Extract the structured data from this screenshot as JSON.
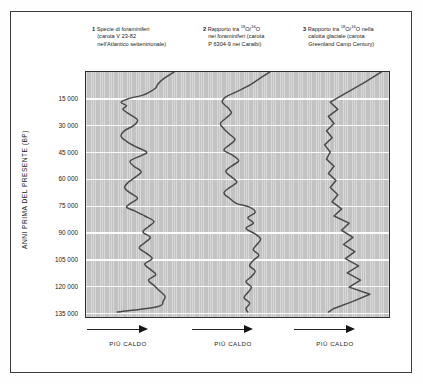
{
  "figure": {
    "yaxis": {
      "title": "ANNI PRIMA DEL PRESENTE (BP)",
      "ticks": [
        "15 000",
        "30 000",
        "45 000",
        "60 000",
        "75 000",
        "90 000",
        "105 000",
        "120 000",
        "135 000"
      ],
      "tick_values": [
        15000,
        30000,
        45000,
        60000,
        75000,
        90000,
        105000,
        120000,
        135000
      ],
      "range": [
        0,
        138000
      ]
    },
    "panels": [
      {
        "number": "1",
        "lines": [
          "Specie di foraminiferi",
          "(carota V 23-82",
          "nell'Atlantico settentrionale)"
        ],
        "footer": "PIÙ CALDO",
        "arrow": "right-arrow-icon"
      },
      {
        "number": "2",
        "lines_html": [
          "Rapporto tra <sup>18</sup>O/<sup>16</sup>O",
          "nei foraminiferi (carota",
          "P 6304-9 nei Caraibi)"
        ],
        "footer": "PIÙ CALDO",
        "arrow": "right-arrow-icon"
      },
      {
        "number": "3",
        "lines_html": [
          "Rapporto tra <sup>18</sup>O/<sup>16</sup>O nella",
          "calotta glaciale (carota",
          "Greenland Camp Century)"
        ],
        "footer": "PIÙ CALDO",
        "arrow": "right-arrow-icon"
      }
    ],
    "colors": {
      "plot_background": "#c9c9c9",
      "gridline": "#fbfbfb",
      "curve": "#4a4a4a",
      "frame": "#3c3c3c",
      "text": "#1a1a1a"
    }
  },
  "chart_data": {
    "type": "line",
    "title": "",
    "orientation": "vertical-time-axis",
    "xlabel": "PIÙ CALDO",
    "ylabel": "ANNI PRIMA DEL PRESENTE (BP)",
    "ylim": [
      0,
      138000
    ],
    "y_inverted": true,
    "grid": true,
    "legend_position": "top",
    "note": "x values are relative warmth proxy in panel-local units 0-100 (higher = warmer/right)",
    "series": [
      {
        "name": "Specie di foraminiferi (carota V 23-82 nell'Atlantico settentrionale)",
        "panel": 1,
        "y": [
          0,
          4000,
          7000,
          9000,
          11000,
          13000,
          15000,
          17000,
          19000,
          21000,
          24000,
          27000,
          30000,
          33000,
          36000,
          39000,
          42000,
          45000,
          47000,
          50000,
          53000,
          56000,
          59000,
          62000,
          65000,
          68000,
          71000,
          74000,
          76000,
          78000,
          81000,
          84000,
          87000,
          90000,
          93000,
          96000,
          99000,
          102000,
          105000,
          108000,
          111000,
          114000,
          117000,
          120000,
          123000,
          126000,
          129000,
          132000,
          135000
        ],
        "x": [
          92,
          80,
          74,
          72,
          66,
          58,
          42,
          34,
          40,
          36,
          44,
          52,
          48,
          38,
          34,
          40,
          50,
          62,
          56,
          44,
          48,
          56,
          50,
          42,
          38,
          44,
          52,
          44,
          40,
          48,
          60,
          70,
          64,
          58,
          66,
          60,
          54,
          62,
          68,
          60,
          66,
          72,
          64,
          70,
          76,
          82,
          80,
          74,
          30
        ]
      },
      {
        "name": "Rapporto tra 18O/16O nei foraminiferi (carota P 6304-9 nei Caraibi)",
        "panel": 2,
        "y": [
          0,
          4000,
          8000,
          11000,
          14000,
          17000,
          20000,
          23000,
          26000,
          29000,
          32000,
          35000,
          38000,
          41000,
          44000,
          47000,
          50000,
          53000,
          56000,
          59000,
          62000,
          65000,
          68000,
          71000,
          74000,
          76000,
          79000,
          82000,
          85000,
          88000,
          91000,
          94000,
          97000,
          100000,
          103000,
          106000,
          109000,
          112000,
          115000,
          118000,
          121000,
          124000,
          127000,
          130000,
          133000,
          135000
        ],
        "x": [
          88,
          76,
          64,
          52,
          40,
          36,
          42,
          46,
          40,
          34,
          38,
          44,
          50,
          44,
          38,
          48,
          54,
          46,
          40,
          46,
          52,
          44,
          38,
          44,
          52,
          66,
          72,
          64,
          70,
          62,
          72,
          78,
          74,
          70,
          76,
          70,
          66,
          72,
          68,
          62,
          68,
          64,
          60,
          66,
          62,
          64
        ]
      },
      {
        "name": "Rapporto tra 18O/16O nella calotta glaciale (carota Greenland Camp Century)",
        "panel": 3,
        "y": [
          0,
          6000,
          12000,
          17000,
          21000,
          25000,
          29000,
          33000,
          37000,
          41000,
          45000,
          49000,
          53000,
          57000,
          61000,
          65000,
          69000,
          73000,
          77000,
          81000,
          85000,
          89000,
          93000,
          97000,
          101000,
          105000,
          109000,
          113000,
          117000,
          121000,
          125000,
          129000,
          133000,
          135000
        ],
        "x": [
          96,
          78,
          58,
          42,
          50,
          40,
          46,
          38,
          44,
          36,
          42,
          38,
          46,
          40,
          48,
          42,
          50,
          44,
          54,
          46,
          62,
          54,
          66,
          56,
          68,
          58,
          72,
          60,
          74,
          62,
          84,
          66,
          46,
          40
        ]
      }
    ]
  }
}
